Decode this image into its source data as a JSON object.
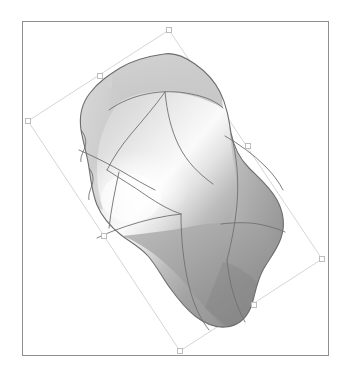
{
  "app": {
    "title": "3D Surface Viewport",
    "background_color": "#ffffff"
  },
  "viewport": {
    "name": "model-viewport",
    "frame_color": "#8e8e8e",
    "frame_rect": {
      "x": 22,
      "y": 21,
      "width": 307,
      "height": 335
    },
    "background_color": "#ffffff"
  },
  "selection": {
    "label": "Rotated selection bounding box",
    "line_color": "#d6d6d6",
    "handle_fill": "#ffffff",
    "handle_stroke": "#bdbdbd",
    "handle_size": 5,
    "rotation_deg": -27,
    "corners": [
      {
        "name": "handle-top",
        "x": 168,
        "y": 29
      },
      {
        "name": "handle-right",
        "x": 321,
        "y": 258
      },
      {
        "name": "handle-bottom",
        "x": 179,
        "y": 350
      },
      {
        "name": "handle-left",
        "x": 27,
        "y": 120
      }
    ],
    "edge_midpoints": [
      {
        "name": "handle-top-right",
        "x": 247,
        "y": 145
      },
      {
        "name": "handle-bottom-right",
        "x": 253,
        "y": 303
      },
      {
        "name": "handle-bottom-left",
        "x": 103,
        "y": 235
      },
      {
        "name": "handle-top-left",
        "x": 99,
        "y": 75
      }
    ]
  },
  "surface": {
    "name": "shaded-freeform-surface",
    "type": "nurbs-patch-model",
    "shading": "smooth-gradient-grayscale",
    "outline_color": "#6e6e6e",
    "patch_line_color": "#707070",
    "highlight_color": "#fbfbfb",
    "midtone_color": "#b9b9b9",
    "shadow_color": "#7d7d7d",
    "deep_shadow_color": "#6a6a6a",
    "patch_count": 9
  },
  "chart_data": {
    "type": "scatter",
    "title": "3D free-form surface render",
    "xlabel": "",
    "ylabel": "",
    "categories": [],
    "values": []
  }
}
